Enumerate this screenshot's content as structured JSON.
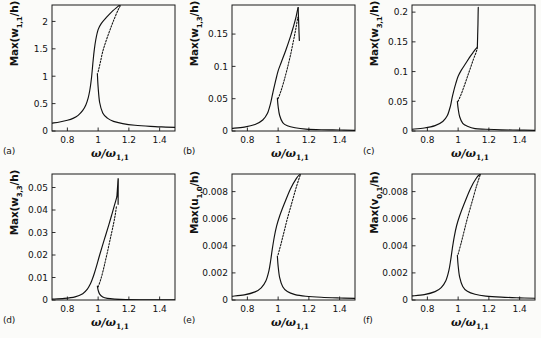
{
  "figure": {
    "type": "multi-panel-line-plot",
    "rows": 2,
    "cols": 3,
    "background": "#fbfbf9",
    "curve_color": "#111111"
  },
  "chart_data": [
    {
      "type": "line",
      "panel": "(a)",
      "xlabel": "ω/ω",
      "xlabel_sub": "1,1",
      "ylabel_prefix": "Max(w",
      "ylabel_sub": "1,1",
      "ylabel_suffix": "/h)",
      "xlim": [
        0.7,
        1.5
      ],
      "ylim": [
        0,
        2.3
      ],
      "xticks": [
        0.8,
        1,
        1.2,
        1.4
      ],
      "xticklabels": [
        "0.8",
        "1",
        "1.2",
        "1.4"
      ],
      "yticks": [
        0,
        0.5,
        1,
        1.5,
        2
      ],
      "yticklabels": [
        "0",
        "0.5",
        "1",
        "1.5",
        "2"
      ],
      "grid": false,
      "legend": "none",
      "series": [
        {
          "name": "stable-lower-branch",
          "style": "solid",
          "x": [
            0.7,
            0.75,
            0.8,
            0.84,
            0.87,
            0.9,
            0.92,
            0.935,
            0.945,
            0.952,
            0.958,
            0.963,
            0.968,
            0.975,
            0.985,
            1.0,
            1.02,
            1.05,
            1.09,
            1.14
          ],
          "y": [
            0.145,
            0.165,
            0.195,
            0.235,
            0.285,
            0.375,
            0.475,
            0.6,
            0.73,
            0.86,
            1.0,
            1.15,
            1.3,
            1.48,
            1.67,
            1.85,
            1.96,
            2.06,
            2.18,
            2.3
          ]
        },
        {
          "name": "stable-upper-right-branch",
          "style": "solid",
          "x": [
            0.995,
            1.0,
            1.01,
            1.03,
            1.06,
            1.1,
            1.16,
            1.24,
            1.34,
            1.44,
            1.5
          ],
          "y": [
            1.05,
            0.8,
            0.52,
            0.33,
            0.235,
            0.175,
            0.135,
            0.105,
            0.085,
            0.072,
            0.065
          ]
        },
        {
          "name": "unstable-branch",
          "style": "dashed",
          "x": [
            1.0,
            1.015,
            1.03,
            1.05,
            1.07,
            1.09,
            1.11,
            1.13,
            1.145
          ],
          "y": [
            1.08,
            1.26,
            1.45,
            1.63,
            1.79,
            1.94,
            2.08,
            2.21,
            2.29
          ]
        }
      ]
    },
    {
      "type": "line",
      "panel": "(b)",
      "xlabel": "ω/ω",
      "xlabel_sub": "1,1",
      "ylabel_prefix": "Max(w",
      "ylabel_sub": "1,3",
      "ylabel_suffix": "/h)",
      "xlim": [
        0.7,
        1.5
      ],
      "ylim": [
        0,
        0.195
      ],
      "xticks": [
        0.8,
        1,
        1.2,
        1.4
      ],
      "xticklabels": [
        "0.8",
        "1",
        "1.2",
        "1.4"
      ],
      "yticks": [
        0,
        0.05,
        0.1,
        0.15
      ],
      "yticklabels": [
        "0",
        "0.05",
        "0.1",
        "0.15"
      ],
      "grid": false,
      "legend": "none",
      "series": [
        {
          "name": "stable-lower-branch",
          "style": "solid",
          "x": [
            0.7,
            0.78,
            0.85,
            0.9,
            0.93,
            0.95,
            0.962,
            0.972,
            0.985,
            1.0,
            1.02,
            1.05,
            1.08,
            1.1,
            1.115,
            1.125,
            1.13
          ],
          "y": [
            0.004,
            0.006,
            0.01,
            0.017,
            0.027,
            0.042,
            0.055,
            0.066,
            0.079,
            0.093,
            0.106,
            0.125,
            0.146,
            0.162,
            0.175,
            0.186,
            0.191
          ]
        },
        {
          "name": "peak-dropoff",
          "style": "solid",
          "x": [
            1.13,
            1.133,
            1.136,
            1.138
          ],
          "y": [
            0.191,
            0.172,
            0.152,
            0.14
          ]
        },
        {
          "name": "stable-right-branch",
          "style": "solid",
          "x": [
            0.995,
            1.0,
            1.01,
            1.03,
            1.06,
            1.11,
            1.18,
            1.28,
            1.4,
            1.5
          ],
          "y": [
            0.051,
            0.038,
            0.024,
            0.013,
            0.008,
            0.005,
            0.003,
            0.002,
            0.0015,
            0.001
          ]
        },
        {
          "name": "unstable-branch",
          "style": "dashed",
          "x": [
            1.0,
            1.02,
            1.04,
            1.06,
            1.08,
            1.1,
            1.115,
            1.128
          ],
          "y": [
            0.05,
            0.063,
            0.079,
            0.097,
            0.117,
            0.14,
            0.158,
            0.176
          ]
        }
      ]
    },
    {
      "type": "line",
      "panel": "(c)",
      "xlabel": "ω/ω",
      "xlabel_sub": "1,1",
      "ylabel_prefix": "Max(w",
      "ylabel_sub": "3,1",
      "ylabel_suffix": "/h)",
      "xlim": [
        0.7,
        1.5
      ],
      "ylim": [
        0,
        0.212
      ],
      "xticks": [
        0.8,
        1,
        1.2,
        1.4
      ],
      "xticklabels": [
        "0.8",
        "1",
        "1.2",
        "1.4"
      ],
      "yticks": [
        0,
        0.05,
        0.1,
        0.15,
        0.2
      ],
      "yticklabels": [
        "0",
        "0.05",
        "0.1",
        "0.15",
        "0.2"
      ],
      "grid": false,
      "legend": "none",
      "series": [
        {
          "name": "stable-lower-branch",
          "style": "solid",
          "x": [
            0.7,
            0.78,
            0.85,
            0.9,
            0.93,
            0.95,
            0.96,
            0.97,
            0.985,
            1.0,
            1.02,
            1.05,
            1.08,
            1.1,
            1.115,
            1.125
          ],
          "y": [
            0.003,
            0.005,
            0.009,
            0.016,
            0.026,
            0.042,
            0.055,
            0.066,
            0.08,
            0.092,
            0.102,
            0.114,
            0.126,
            0.133,
            0.138,
            0.141
          ]
        },
        {
          "name": "vertical-jump",
          "style": "solid",
          "x": [
            1.125,
            1.127,
            1.129,
            1.13,
            1.131
          ],
          "y": [
            0.141,
            0.16,
            0.18,
            0.196,
            0.208
          ]
        },
        {
          "name": "stable-right-branch",
          "style": "solid",
          "x": [
            0.995,
            1.0,
            1.01,
            1.03,
            1.06,
            1.11,
            1.18,
            1.28,
            1.4,
            1.5
          ],
          "y": [
            0.05,
            0.038,
            0.024,
            0.013,
            0.008,
            0.004,
            0.003,
            0.002,
            0.0015,
            0.001
          ]
        },
        {
          "name": "unstable-branch",
          "style": "dashed",
          "x": [
            1.0,
            1.02,
            1.04,
            1.06,
            1.08,
            1.1,
            1.115,
            1.125
          ],
          "y": [
            0.05,
            0.062,
            0.076,
            0.091,
            0.106,
            0.121,
            0.131,
            0.139
          ]
        }
      ]
    },
    {
      "type": "line",
      "panel": "(d)",
      "xlabel": "ω/ω",
      "xlabel_sub": "1,1",
      "ylabel_prefix": "Max(w",
      "ylabel_sub": "3,3",
      "ylabel_suffix": "/h)",
      "xlim": [
        0.7,
        1.5
      ],
      "ylim": [
        0,
        0.056
      ],
      "xticks": [
        0.8,
        1,
        1.2,
        1.4
      ],
      "xticklabels": [
        "0.8",
        "1",
        "1.2",
        "1.4"
      ],
      "yticks": [
        0,
        0.01,
        0.02,
        0.03,
        0.04,
        0.05
      ],
      "yticklabels": [
        "0",
        "0.01",
        "0.02",
        "0.03",
        "0.04",
        "0.05"
      ],
      "grid": false,
      "legend": "none",
      "series": [
        {
          "name": "stable-lower-branch",
          "style": "solid",
          "x": [
            0.7,
            0.78,
            0.85,
            0.9,
            0.93,
            0.95,
            0.962,
            0.975,
            0.99,
            1.01,
            1.04,
            1.07,
            1.09,
            1.105,
            1.115,
            1.122
          ],
          "y": [
            0.0004,
            0.0007,
            0.0014,
            0.0028,
            0.0048,
            0.0072,
            0.0092,
            0.0118,
            0.0152,
            0.02,
            0.0268,
            0.0335,
            0.0382,
            0.0418,
            0.0442,
            0.0458
          ]
        },
        {
          "name": "jagged-spike",
          "style": "solid",
          "x": [
            1.122,
            1.124,
            1.123,
            1.126,
            1.124,
            1.128,
            1.126,
            1.129,
            1.127,
            1.13,
            1.128,
            1.131,
            1.13
          ],
          "y": [
            0.0458,
            0.048,
            0.0462,
            0.05,
            0.0478,
            0.0518,
            0.0495,
            0.0532,
            0.0508,
            0.054,
            0.0515,
            0.0538,
            0.0425
          ]
        },
        {
          "name": "stable-right-branch",
          "style": "solid",
          "x": [
            0.995,
            1.0,
            1.01,
            1.03,
            1.06,
            1.11,
            1.18,
            1.28,
            1.4,
            1.5
          ],
          "y": [
            0.0062,
            0.0044,
            0.0026,
            0.0013,
            0.0007,
            0.0004,
            0.0002,
            0.0001,
            0.0001,
            0.0001
          ]
        },
        {
          "name": "unstable-branch",
          "style": "dashed",
          "x": [
            1.0,
            1.02,
            1.04,
            1.06,
            1.08,
            1.1,
            1.112,
            1.12
          ],
          "y": [
            0.0058,
            0.0098,
            0.0152,
            0.0212,
            0.0275,
            0.0338,
            0.0382,
            0.042
          ]
        }
      ]
    },
    {
      "type": "line",
      "panel": "(e)",
      "xlabel": "ω/ω",
      "xlabel_sub": "1,1",
      "ylabel_prefix": "Max(u",
      "ylabel_sub": "1,0",
      "ylabel_suffix": "/h)",
      "xlim": [
        0.7,
        1.5
      ],
      "ylim": [
        0,
        0.0093
      ],
      "xticks": [
        0.8,
        1,
        1.2,
        1.4
      ],
      "xticklabels": [
        "0.8",
        "1",
        "1.2",
        "1.4"
      ],
      "yticks": [
        0,
        0.002,
        0.004,
        0.006,
        0.008
      ],
      "yticklabels": [
        "0",
        "0.002",
        "0.004",
        "0.006",
        "0.008"
      ],
      "grid": false,
      "legend": "none",
      "series": [
        {
          "name": "stable-lower-branch",
          "style": "solid",
          "x": [
            0.7,
            0.78,
            0.85,
            0.89,
            0.92,
            0.94,
            0.952,
            0.962,
            0.975,
            0.99,
            1.01,
            1.04,
            1.08,
            1.12,
            1.145
          ],
          "y": [
            0.00028,
            0.00038,
            0.0006,
            0.0009,
            0.0014,
            0.00215,
            0.00295,
            0.00375,
            0.00465,
            0.00545,
            0.0062,
            0.0071,
            0.0082,
            0.009,
            0.0093
          ]
        },
        {
          "name": "stable-right-branch",
          "style": "solid",
          "x": [
            0.995,
            1.0,
            1.01,
            1.03,
            1.06,
            1.11,
            1.18,
            1.28,
            1.4,
            1.5
          ],
          "y": [
            0.00325,
            0.0025,
            0.00165,
            0.00098,
            0.00062,
            0.0004,
            0.00028,
            0.0002,
            0.00015,
            0.00012
          ]
        },
        {
          "name": "unstable-branch",
          "style": "dashed",
          "x": [
            1.0,
            1.02,
            1.04,
            1.06,
            1.09,
            1.12,
            1.145
          ],
          "y": [
            0.00335,
            0.0042,
            0.0051,
            0.006,
            0.0072,
            0.0084,
            0.00925
          ]
        }
      ]
    },
    {
      "type": "line",
      "panel": "(f)",
      "xlabel": "ω/ω",
      "xlabel_sub": "1,1",
      "ylabel_prefix": "Max(v",
      "ylabel_sub": "0,1",
      "ylabel_suffix": "/h)",
      "xlim": [
        0.7,
        1.5
      ],
      "ylim": [
        0,
        0.0093
      ],
      "xticks": [
        0.8,
        1,
        1.2,
        1.4
      ],
      "xticklabels": [
        "0.8",
        "1",
        "1.2",
        "1.4"
      ],
      "yticks": [
        0,
        0.002,
        0.004,
        0.006,
        0.008
      ],
      "yticklabels": [
        "0",
        "0.002",
        "0.004",
        "0.006",
        "0.008"
      ],
      "grid": false,
      "legend": "none",
      "series": [
        {
          "name": "stable-lower-branch",
          "style": "solid",
          "x": [
            0.7,
            0.78,
            0.85,
            0.89,
            0.92,
            0.94,
            0.952,
            0.962,
            0.975,
            0.99,
            1.01,
            1.04,
            1.08,
            1.12,
            1.145
          ],
          "y": [
            0.0003,
            0.0004,
            0.00062,
            0.00092,
            0.00142,
            0.00218,
            0.00298,
            0.00378,
            0.00468,
            0.00548,
            0.00622,
            0.00712,
            0.00822,
            0.00902,
            0.0093
          ]
        },
        {
          "name": "stable-right-branch",
          "style": "solid",
          "x": [
            0.995,
            1.0,
            1.01,
            1.03,
            1.06,
            1.11,
            1.18,
            1.28,
            1.4,
            1.5
          ],
          "y": [
            0.0033,
            0.00255,
            0.00168,
            0.001,
            0.00064,
            0.00042,
            0.00029,
            0.00021,
            0.00016,
            0.00013
          ]
        },
        {
          "name": "unstable-branch",
          "style": "dashed",
          "x": [
            1.0,
            1.02,
            1.04,
            1.06,
            1.09,
            1.12,
            1.145
          ],
          "y": [
            0.00338,
            0.00422,
            0.00512,
            0.00602,
            0.00722,
            0.00842,
            0.00928
          ]
        }
      ]
    }
  ]
}
